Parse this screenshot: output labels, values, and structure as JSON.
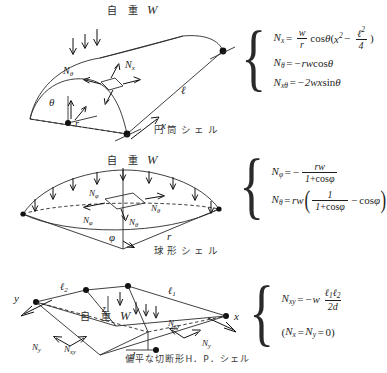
{
  "figures": [
    {
      "id": "cylindrical-shell",
      "caption": "円筒シェル",
      "load_label": "自 重",
      "load_symbol": "W",
      "diagram_labels": {
        "n_theta": "N",
        "n_theta_sub": "θ",
        "n_x": "N",
        "n_x_sub": "x",
        "angle": "θ",
        "radius": "r",
        "length": "ℓ",
        "axis_x": "x"
      },
      "equations": [
        "N_x = (w/r) cos θ (x² − ℓ²/4)",
        "N_θ = −rw cos θ",
        "N_xθ = −2wx sin θ"
      ]
    },
    {
      "id": "spherical-shell",
      "caption": "球形シェル",
      "load_label": "自 重",
      "load_symbol": "W",
      "diagram_labels": {
        "n_phi": "N",
        "n_phi_sub": "φ",
        "n_theta": "N",
        "n_theta_sub": "θ",
        "angle": "φ",
        "radius": "r"
      },
      "equations": [
        "N_φ = − rw / (1 + cos φ)",
        "N_θ = rw ( 1/(1 + cos φ) − cos φ )"
      ]
    },
    {
      "id": "hp-shell",
      "caption": "偏平な切断形H．P．シェル",
      "load_label": "自 重",
      "load_symbol": "W",
      "diagram_labels": {
        "axis_x": "x",
        "axis_y": "y",
        "axis_z": "z",
        "edge_1": "ℓ",
        "edge_1_sub": "1",
        "edge_2": "ℓ",
        "edge_2_sub": "2",
        "depth": "d",
        "n_y": "N",
        "n_y_sub": "y",
        "n_xy": "N",
        "n_xy_sub": "xy"
      },
      "equations": [
        "N_xy = −w ℓ₁ℓ₂ / (2d)",
        "(N_x = N_y = 0)"
      ]
    }
  ],
  "symbols": {
    "N": "N",
    "w_lower": "w",
    "r": "r",
    "d": "d",
    "x": "x",
    "two": "2",
    "four": "4",
    "one": "1",
    "zero": "0",
    "theta": "θ",
    "phi": "φ",
    "cos": "cos",
    "sin": "sin",
    "eq": "=",
    "minus": "−",
    "minus2w": "−2",
    "lparen": "(",
    "rparen": ")",
    "ell": "ℓ",
    "sub_x": "x",
    "sub_theta": "θ",
    "sub_xtheta": "xθ",
    "sub_phi": "φ",
    "sub_xy": "xy",
    "sub_y": "y",
    "sub_1": "1",
    "sub_2": "2",
    "sup_2": "2"
  },
  "colors": {
    "ink": "#1a1a1a",
    "line": "#2a2a2a",
    "background": "#ffffff"
  }
}
